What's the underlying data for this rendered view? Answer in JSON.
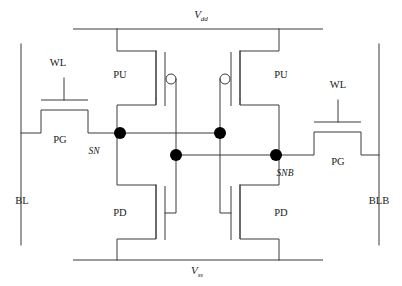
{
  "figure": {
    "kind": "circuit-schematic",
    "name": "6T SRAM bit cell",
    "width": 402,
    "height": 286,
    "background_color": "#ffffff",
    "line_color": "#3b3b3b",
    "node_color": "#000000"
  },
  "rails": {
    "top": {
      "label_base": "V",
      "label_sub": "dd",
      "label_x": 201,
      "label_y": 18,
      "y": 29,
      "x1": 73,
      "x2": 323
    },
    "bottom": {
      "label_base": "V",
      "label_sub": "ss",
      "label_x": 197,
      "label_y": 274,
      "y": 260,
      "x1": 73,
      "x2": 323
    }
  },
  "bitlines": {
    "left": {
      "label": "BL",
      "label_x": 22,
      "label_y": 204,
      "x": 21,
      "y1": 44,
      "y2": 245
    },
    "right": {
      "label": "BLB",
      "label_x": 379,
      "label_y": 204,
      "x": 379,
      "y1": 44,
      "y2": 245
    }
  },
  "wordlines": [
    {
      "label": "WL",
      "label_x": 58,
      "label_y": 66
    },
    {
      "label": "WL",
      "label_x": 338,
      "label_y": 88
    }
  ],
  "transistors": [
    {
      "id": "pg-left",
      "label": "PG",
      "type": "nmos",
      "label_x": 60,
      "label_y": 143
    },
    {
      "id": "pg-right",
      "label": "PG",
      "type": "nmos",
      "label_x": 338,
      "label_y": 165
    },
    {
      "id": "pu-left",
      "label": "PU",
      "type": "pmos",
      "label_x": 120,
      "label_y": 78
    },
    {
      "id": "pu-right",
      "label": "PU",
      "type": "pmos",
      "label_x": 281,
      "label_y": 78
    },
    {
      "id": "pd-left",
      "label": "PD",
      "type": "nmos",
      "label_x": 120,
      "label_y": 216
    },
    {
      "id": "pd-right",
      "label": "PD",
      "type": "nmos",
      "label_x": 281,
      "label_y": 216
    }
  ],
  "storage_nodes": [
    {
      "label": "SN",
      "label_x": 94,
      "label_y": 154
    },
    {
      "label": "SNB",
      "label_x": 285,
      "label_y": 176
    }
  ],
  "node_dots": [
    {
      "name": "sn-dot-upper",
      "cx": 120,
      "cy": 133,
      "r": 6
    },
    {
      "name": "snb-gate-dot",
      "cx": 220,
      "cy": 133,
      "r": 6
    },
    {
      "name": "sn-gate-dot",
      "cx": 176,
      "cy": 155,
      "r": 6
    },
    {
      "name": "snb-dot-lower",
      "cx": 276,
      "cy": 155,
      "r": 6
    }
  ]
}
